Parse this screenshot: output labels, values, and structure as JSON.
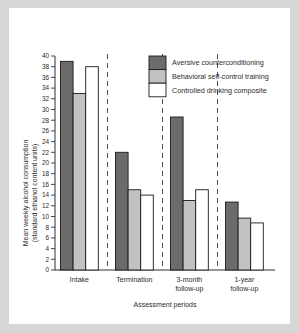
{
  "chart_data": {
    "type": "bar",
    "title": "",
    "xlabel": "Assessment periods",
    "ylabel": "Mean weekly alcohol consumption (standard ethanol content units)",
    "ylabel_line1": "Mean weekly alcohol consumption",
    "ylabel_line2": "(standard ethanol content units)",
    "categories": [
      "Intake",
      "Termination",
      "3-month follow-up",
      "1-year follow-up"
    ],
    "category_lines": [
      [
        "Intake"
      ],
      [
        "Termination"
      ],
      [
        "3-month",
        "follow-up"
      ],
      [
        "1-year",
        "follow-up"
      ]
    ],
    "series": [
      {
        "name": "Aversive counterconditioning",
        "color": "#6b6b6b",
        "values": [
          39.0,
          22.0,
          28.6,
          12.7
        ]
      },
      {
        "name": "Behavioral self-control training",
        "color": "#c2c2c2",
        "values": [
          33.0,
          15.0,
          13.0,
          9.7
        ]
      },
      {
        "name": "Controlled drinking composite",
        "color": "#ffffff",
        "values": [
          38.0,
          14.0,
          15.0,
          8.8
        ]
      }
    ],
    "ylim": [
      0,
      40
    ],
    "ytick_step": 2,
    "yticks": [
      0,
      2,
      4,
      6,
      8,
      10,
      12,
      14,
      16,
      18,
      20,
      22,
      24,
      26,
      28,
      30,
      32,
      34,
      36,
      38,
      40
    ],
    "grid": false,
    "legend_position": "top-right",
    "separators_between_groups": true,
    "separator_style": "dashed-vertical"
  },
  "figure": {
    "background": "#ffffff",
    "page_background": "#d7d7d7",
    "axis_color": "#1a1a1a"
  }
}
